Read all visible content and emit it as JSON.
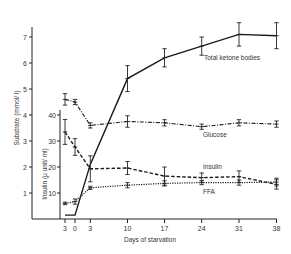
{
  "chart_data": {
    "type": "line",
    "title": "",
    "xlabel": "Days of starvation",
    "ylabel": "Substrate (mmol/ l)",
    "y2label": "Insulin (μ unit/ ml)",
    "x": [
      -3,
      0,
      3,
      10,
      17,
      24,
      31,
      38
    ],
    "x_tick_labels": [
      "3",
      "0",
      "3",
      "10",
      "17",
      "24",
      "31",
      "38"
    ],
    "y_ticks": [
      1,
      2,
      3,
      4,
      5,
      6,
      7
    ],
    "y2_ticks": [
      10,
      20,
      30,
      40
    ],
    "ylim": [
      0,
      7.5
    ],
    "y2lim": [
      0,
      40
    ],
    "grid": false,
    "legend_position": "inline labels",
    "series": [
      {
        "name": "Total ketone bodies",
        "axis": "substrate",
        "style": "solid",
        "x": [
          -3,
          0,
          3,
          10,
          17,
          24,
          31,
          38
        ],
        "values": [
          0.15,
          0.15,
          2.1,
          5.4,
          6.2,
          6.65,
          7.1,
          7.05
        ],
        "errors": [
          0,
          0,
          0,
          0.5,
          0.35,
          0.35,
          0.45,
          0.5
        ]
      },
      {
        "name": "Glucose",
        "axis": "substrate",
        "style": "dash-dot",
        "x": [
          -3,
          0,
          3,
          10,
          17,
          24,
          31,
          38
        ],
        "values": [
          4.6,
          4.5,
          3.6,
          3.75,
          3.7,
          3.55,
          3.7,
          3.65
        ],
        "errors": [
          0.22,
          0.1,
          0.1,
          0.22,
          0.12,
          0.1,
          0.12,
          0.12
        ]
      },
      {
        "name": "Insulin",
        "axis": "insulin",
        "style": "dashed",
        "x": [
          -3,
          0,
          3,
          10,
          17,
          24,
          31,
          38
        ],
        "values": [
          33.5,
          27.7,
          19.3,
          19.6,
          16.5,
          15.9,
          16.3,
          13.3
        ],
        "errors": [
          4.8,
          3.2,
          5.0,
          2.5,
          3.5,
          1.8,
          2.2,
          1.8
        ]
      },
      {
        "name": "FFA",
        "axis": "substrate",
        "style": "dotted",
        "x": [
          -3,
          0,
          3,
          10,
          17,
          24,
          31,
          38
        ],
        "values": [
          0.6,
          0.67,
          1.2,
          1.3,
          1.37,
          1.4,
          1.4,
          1.42
        ],
        "errors": [
          0.05,
          0.1,
          0.06,
          0.1,
          0.1,
          0.08,
          0.1,
          0.15
        ]
      }
    ]
  },
  "labels": {
    "ketone": "Total ketone bodies",
    "glucose": "Glucose",
    "insulin": "Insulin",
    "ffa": "FFA",
    "xlabel": "Days of starvation",
    "ylabel": "Substrate (mmol/ l)",
    "y2label": "Insulin (μ unit/ ml)"
  }
}
